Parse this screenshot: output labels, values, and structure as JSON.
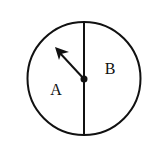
{
  "diagram": {
    "type": "spinner",
    "colors": {
      "stroke": "#111111",
      "background": "#ffffff"
    },
    "sections": [
      {
        "id": "A",
        "label": "A",
        "side": "left",
        "fraction": "1/2"
      },
      {
        "id": "B",
        "label": "B",
        "side": "right",
        "fraction": "1/2"
      }
    ],
    "pointer": {
      "points_to": "A",
      "direction": "upper-left"
    }
  }
}
